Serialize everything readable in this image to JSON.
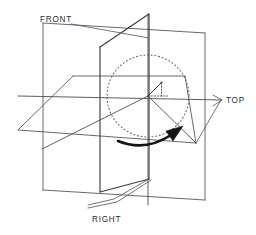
{
  "diagram": {
    "background_color": "#ffffff",
    "line_color": "#55595c",
    "accent_color": "#141414",
    "labels": {
      "front": "FRONT",
      "top": "TOP",
      "right": "RIGHT"
    },
    "annotations": {
      "rotation_circle": "dotted-rotation-circle",
      "rotation_arrow": "curved-rotation-arrow",
      "angle_mark": "angle-tick-mark",
      "origin": "origin-point"
    },
    "geometry": {
      "origin": [
        148,
        96
      ],
      "circle_center": [
        148,
        96
      ],
      "circle_radius": 41,
      "top_axis_end": [
        222,
        100
      ],
      "front_plane_label_anchor": [
        40,
        22
      ],
      "top_plane_label_anchor": [
        226,
        103
      ],
      "right_plane_label_anchor": [
        92,
        222
      ]
    }
  }
}
